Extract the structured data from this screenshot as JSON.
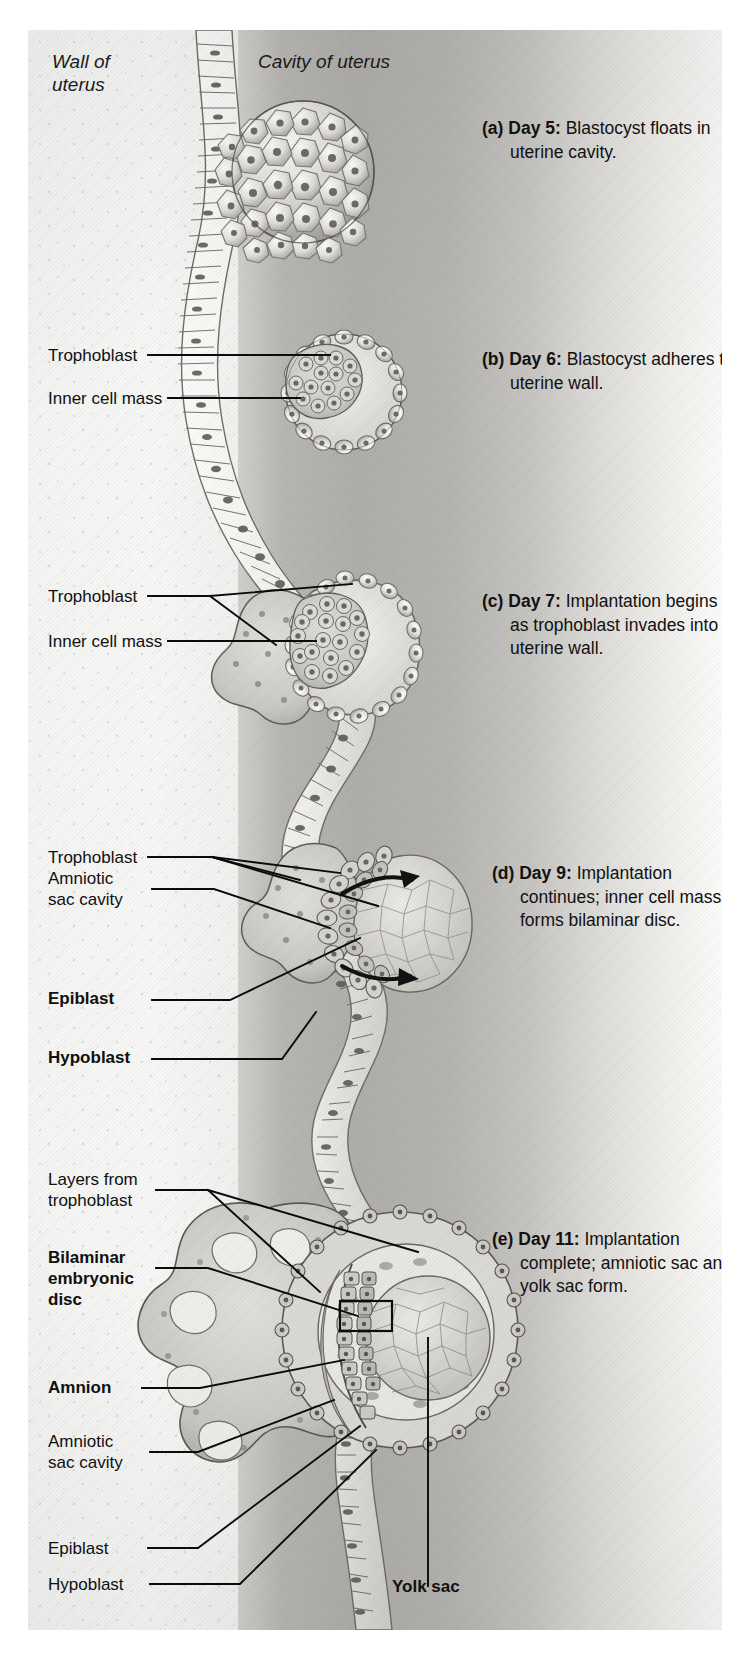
{
  "figure": {
    "orientation_labels": {
      "wall": "Wall of\nuterus",
      "cavity": "Cavity of uterus"
    }
  },
  "colors": {
    "background": "#ffffff",
    "plate_light": "#f4f4f3",
    "plate_mid": "#b8b6b2",
    "plate_dark": "#b0aeaa",
    "ink": "#101010",
    "leader_line": "#0b0b0b",
    "tissue_outline": "#6d6b67",
    "tissue_fill": "#c9c7c2",
    "cell_fill": "#e8e7e3",
    "nucleus": "#7b7975"
  },
  "panels": [
    {
      "id": "a",
      "marker": "(a)",
      "day": "Day 5:",
      "text": " Blastocyst floats in uterine cavity.",
      "caption_full": "(a) Day 5: Blastocyst floats in uterine cavity.",
      "labels": []
    },
    {
      "id": "b",
      "marker": "(b)",
      "day": "Day 6:",
      "text": " Blastocyst adheres to uterine wall.",
      "caption_full": "(b) Day 6: Blastocyst adheres to uterine wall.",
      "labels": [
        {
          "text": "Trophoblast",
          "bold": false
        },
        {
          "text": "Inner cell mass",
          "bold": false
        }
      ]
    },
    {
      "id": "c",
      "marker": "(c)",
      "day": "Day 7:",
      "text": " Implantation begins as trophoblast invades into uterine wall.",
      "caption_full": "(c) Day 7: Implantation begins as trophoblast invades into uterine wall.",
      "labels": [
        {
          "text": "Trophoblast",
          "bold": false
        },
        {
          "text": "Inner cell mass",
          "bold": false
        }
      ]
    },
    {
      "id": "d",
      "marker": "(d)",
      "day": "Day 9:",
      "text": " Implantation continues; inner cell mass forms bilaminar disc.",
      "caption_full": "(d) Day 9: Implantation continues; inner cell mass forms bilaminar disc.",
      "labels": [
        {
          "text": "Trophoblast",
          "bold": false
        },
        {
          "text": "Amniotic\nsac cavity",
          "bold": false
        },
        {
          "text": "Epiblast",
          "bold": true
        },
        {
          "text": "Hypoblast",
          "bold": true
        }
      ]
    },
    {
      "id": "e",
      "marker": "(e)",
      "day": "Day 11:",
      "text": " Implantation complete; amniotic sac and yolk sac form.",
      "caption_full": "(e) Day 11: Implantation complete; amniotic sac and yolk sac form.",
      "labels": [
        {
          "text": "Layers from\ntrophoblast",
          "bold": false
        },
        {
          "text": "Bilaminar\nembryonic\ndisc",
          "bold": true
        },
        {
          "text": "Amnion",
          "bold": true
        },
        {
          "text": "Amniotic\nsac cavity",
          "bold": false
        },
        {
          "text": "Epiblast",
          "bold": false
        },
        {
          "text": "Hypoblast",
          "bold": false
        },
        {
          "text": "Yolk sac",
          "bold": true
        }
      ]
    }
  ],
  "labels": {
    "wall_of_uterus": "Wall of\nuterus",
    "cavity_of_uterus": "Cavity of uterus",
    "trophoblast_b": "Trophoblast",
    "inner_cell_mass_b": "Inner cell mass",
    "trophoblast_c": "Trophoblast",
    "inner_cell_mass_c": "Inner cell mass",
    "trophoblast_d": "Trophoblast",
    "amniotic_sac_cavity_d": "Amniotic\nsac cavity",
    "epiblast_d": "Epiblast",
    "hypoblast_d": "Hypoblast",
    "layers_from_trophoblast_e": "Layers from\ntrophoblast",
    "bilaminar_embryonic_disc_e": "Bilaminar\nembryonic\ndisc",
    "amnion_e": "Amnion",
    "amniotic_sac_cavity_e": "Amniotic\nsac cavity",
    "epiblast_e": "Epiblast",
    "hypoblast_e": "Hypoblast",
    "yolk_sac_e": "Yolk sac"
  },
  "captions": {
    "a_marker": "(a)",
    "a_day": "Day 5:",
    "a_rest": " Blastocyst floats in uterine cavity.",
    "b_marker": "(b)",
    "b_day": "Day 6:",
    "b_rest": " Blastocyst adheres to uterine wall.",
    "c_marker": "(c)",
    "c_day": "Day 7:",
    "c_rest": " Implantation begins as trophoblast invades into uterine wall.",
    "d_marker": "(d)",
    "d_day": "Day 9:",
    "d_rest": " Implantation continues; inner cell mass forms bilaminar disc.",
    "e_marker": "(e)",
    "e_day": "Day 11:",
    "e_rest": " Implantation complete; amniotic sac and yolk sac form."
  }
}
